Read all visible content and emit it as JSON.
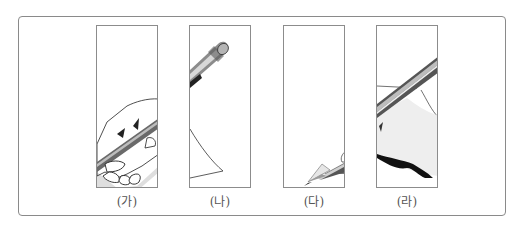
{
  "figure": {
    "panels": [
      {
        "label": "(가)",
        "depicts": "hand gripping pencil shaft"
      },
      {
        "label": "(나)",
        "depicts": "pencil eraser end and paper corner"
      },
      {
        "label": "(다)",
        "depicts": "sharpened pencil tip"
      },
      {
        "label": "(라)",
        "depicts": "pencil resting on hand"
      }
    ]
  }
}
